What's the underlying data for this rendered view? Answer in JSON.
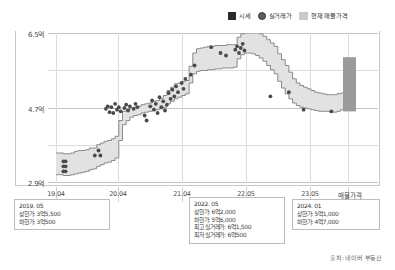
{
  "legend": {
    "items": [
      {
        "label": "시세",
        "marker": "square-swatch",
        "color": "#2b2b2b"
      },
      {
        "label": "실거래가",
        "marker": "circle-dot",
        "color": "#5c5c5c"
      },
      {
        "label": "현재 매물가격",
        "marker": "band-swatch",
        "color": "#c9c9c9"
      }
    ]
  },
  "source": "출처: 네이버 부동산",
  "annotations": [
    {
      "id": "left",
      "date": "2019. 05",
      "rows": [
        {
          "label": "상한가",
          "value": "3억5,500"
        },
        {
          "label": "하한가",
          "value": "3억500"
        }
      ]
    },
    {
      "id": "mid",
      "date": "2022. 05",
      "rows": [
        {
          "label": "상한가",
          "value": "6억2,000"
        },
        {
          "label": "하한가",
          "value": "5억6,000"
        },
        {
          "label": "최고 실거래가",
          "value": "6억1,500"
        },
        {
          "label": "최저 실거래가",
          "value": "6억500"
        }
      ]
    },
    {
      "id": "right",
      "date": "2024. 01",
      "rows": [
        {
          "label": "상한가",
          "value": "5억1,000"
        },
        {
          "label": "하한가",
          "value": "4억7,000"
        }
      ]
    }
  ],
  "chart_data": {
    "type": "area",
    "title": "",
    "xlabel": "",
    "ylabel": "",
    "grid": true,
    "legend_position": "top-right",
    "unit": "억원",
    "ylim": [
      2.9,
      6.5
    ],
    "ytick_labels": [
      "2.9억",
      "4.7억",
      "6.5억"
    ],
    "ytick_values": [
      2.9,
      4.7,
      6.5
    ],
    "xtick_labels": [
      "19.04",
      "20.04",
      "21.04",
      "22.05",
      "23.05",
      "매물가격"
    ],
    "series": [
      {
        "name": "시세 상한가",
        "type": "step",
        "values": [
          3.62,
          3.62,
          3.6,
          3.6,
          3.62,
          3.66,
          3.68,
          3.68,
          3.7,
          3.74,
          3.74,
          3.82,
          3.86,
          3.9,
          3.92,
          3.96,
          4.02,
          4.4,
          4.62,
          4.66,
          4.7,
          4.72,
          4.74,
          4.78,
          4.8,
          4.82,
          4.86,
          4.88,
          4.92,
          5.0,
          5.12,
          5.2,
          5.28,
          5.3,
          5.34,
          5.36,
          5.7,
          6.02,
          6.12,
          6.14,
          6.16,
          6.18,
          6.18,
          6.2,
          6.2,
          6.2,
          6.22,
          6.22,
          6.22,
          6.4,
          6.48,
          6.5,
          6.5,
          6.5,
          6.5,
          6.48,
          6.42,
          6.34,
          6.26,
          6.18,
          6.0,
          5.86,
          5.72,
          5.56,
          5.4,
          5.3,
          5.24,
          5.2,
          5.16,
          5.12,
          5.08,
          5.06,
          5.04,
          5.02,
          5.02,
          5.02,
          5.04,
          5.06,
          5.08,
          5.1
        ]
      },
      {
        "name": "시세 하한가",
        "type": "step",
        "values": [
          3.1,
          3.1,
          3.08,
          3.08,
          3.1,
          3.12,
          3.14,
          3.16,
          3.18,
          3.22,
          3.24,
          3.3,
          3.34,
          3.38,
          3.4,
          3.44,
          3.5,
          3.92,
          4.3,
          4.4,
          4.48,
          4.52,
          4.54,
          4.58,
          4.6,
          4.62,
          4.64,
          4.66,
          4.68,
          4.72,
          4.8,
          4.86,
          4.92,
          4.96,
          5.0,
          5.04,
          5.3,
          5.52,
          5.58,
          5.6,
          5.6,
          5.62,
          5.62,
          5.64,
          5.64,
          5.66,
          5.66,
          5.66,
          5.68,
          5.88,
          5.98,
          6.02,
          6.02,
          6.0,
          5.96,
          5.9,
          5.82,
          5.72,
          5.62,
          5.52,
          5.34,
          5.18,
          5.04,
          4.92,
          4.82,
          4.76,
          4.72,
          4.7,
          4.68,
          4.66,
          4.64,
          4.62,
          4.62,
          4.62,
          4.6,
          4.6,
          4.62,
          4.66,
          4.7,
          4.7
        ]
      }
    ],
    "scatter": {
      "name": "실거래가",
      "points": [
        [
          2.0,
          3.42
        ],
        [
          2.0,
          3.3
        ],
        [
          2.0,
          3.18
        ],
        [
          2.6,
          3.42
        ],
        [
          2.6,
          3.3
        ],
        [
          2.6,
          3.18
        ],
        [
          10.5,
          3.56
        ],
        [
          11.5,
          3.68
        ],
        [
          12.0,
          3.56
        ],
        [
          13.5,
          4.68
        ],
        [
          14.0,
          4.74
        ],
        [
          14.5,
          4.6
        ],
        [
          15.0,
          4.72
        ],
        [
          15.5,
          4.58
        ],
        [
          16.0,
          4.8
        ],
        [
          16.5,
          4.66
        ],
        [
          17.0,
          4.72
        ],
        [
          17.5,
          4.62
        ],
        [
          18.5,
          4.7
        ],
        [
          19.0,
          4.78
        ],
        [
          19.5,
          4.64
        ],
        [
          20.0,
          4.74
        ],
        [
          21.0,
          4.68
        ],
        [
          21.5,
          4.8
        ],
        [
          22.0,
          4.72
        ],
        [
          24.0,
          4.52
        ],
        [
          24.5,
          4.4
        ],
        [
          25.5,
          4.74
        ],
        [
          26.0,
          4.88
        ],
        [
          26.5,
          4.66
        ],
        [
          27.0,
          4.8
        ],
        [
          27.5,
          4.58
        ],
        [
          28.0,
          4.96
        ],
        [
          28.5,
          4.72
        ],
        [
          29.0,
          4.86
        ],
        [
          29.5,
          4.64
        ],
        [
          30.0,
          4.78
        ],
        [
          30.5,
          5.06
        ],
        [
          31.0,
          4.92
        ],
        [
          31.5,
          5.14
        ],
        [
          32.0,
          4.98
        ],
        [
          32.5,
          5.22
        ],
        [
          33.0,
          5.08
        ],
        [
          34.0,
          5.3
        ],
        [
          34.5,
          5.16
        ],
        [
          35.0,
          5.4
        ],
        [
          36.5,
          5.5
        ],
        [
          37.5,
          5.72
        ],
        [
          42.0,
          6.16
        ],
        [
          44.5,
          6.02
        ],
        [
          46.0,
          5.96
        ],
        [
          48.5,
          6.1
        ],
        [
          49.0,
          6.18
        ],
        [
          49.5,
          6.02
        ],
        [
          50.0,
          6.14
        ],
        [
          50.5,
          6.24
        ],
        [
          51.0,
          6.08
        ],
        [
          58.0,
          4.98
        ],
        [
          63.0,
          5.08
        ],
        [
          67.0,
          4.66
        ],
        [
          74.5,
          4.62
        ]
      ]
    },
    "current_listing_bar": {
      "name": "현재 매물가격",
      "x_index": 79,
      "low": 4.62,
      "high": 5.92,
      "color": "#9a9a9a"
    }
  }
}
